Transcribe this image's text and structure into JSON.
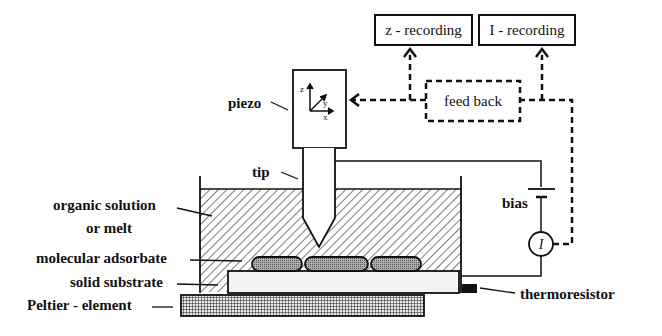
{
  "diagram": {
    "type": "schematic",
    "boxes": {
      "z_recording": "z - recording",
      "i_recording": "I - recording",
      "feedback": "feed back"
    },
    "labels": {
      "piezo": "piezo",
      "tip": "tip",
      "organic_solution_line1": "organic solution",
      "organic_solution_line2": "or melt",
      "molecular_adsorbate": "molecular adsorbate",
      "solid_substrate": "solid substrate",
      "peltier": "Peltier - element",
      "bias": "bias",
      "thermoresistor": "thermoresistor",
      "current_symbol": "I"
    },
    "axes": {
      "x": "x",
      "y": "y",
      "z": "z"
    },
    "colors": {
      "line": "#111111",
      "background": "#ffffff",
      "substrate_fill": "#f2f2f2",
      "adsorbate_fill": "#9a9a9a",
      "thermoresistor_fill": "#111111"
    }
  }
}
